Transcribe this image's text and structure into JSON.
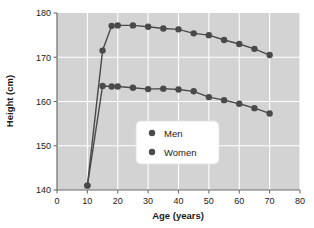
{
  "chart_data": {
    "type": "line",
    "title": "",
    "xlabel": "Age (years)",
    "ylabel": "Height (cm)",
    "xlim": [
      0,
      80
    ],
    "ylim": [
      140,
      180
    ],
    "xticks": [
      0,
      10,
      20,
      30,
      40,
      50,
      60,
      70,
      80
    ],
    "yticks": [
      140,
      150,
      160,
      170,
      180
    ],
    "grid": true,
    "grid_color": "#ffffff",
    "plot_background": "#d3d3d3",
    "figure_background": "#ffffff",
    "series_color": "#4a4a4a",
    "legend_position": "center-right-lower",
    "x": [
      10,
      15,
      18,
      20,
      25,
      30,
      35,
      40,
      45,
      50,
      55,
      60,
      65,
      70
    ],
    "series": [
      {
        "name": "Men",
        "values": [
          141,
          171.5,
          177.1,
          177.2,
          177.2,
          176.9,
          176.5,
          176.3,
          175.4,
          175.0,
          173.9,
          173.0,
          171.9,
          170.5
        ]
      },
      {
        "name": "Women",
        "values": [
          141,
          163.5,
          163.4,
          163.4,
          163.1,
          162.8,
          162.9,
          162.7,
          162.3,
          161.0,
          160.3,
          159.5,
          158.5,
          157.3
        ]
      }
    ],
    "legend": [
      "Men",
      "Women"
    ],
    "marker": "circle",
    "marker_size": 3.2,
    "line_width": 1.4
  },
  "axes": {
    "x_tick_labels": [
      "0",
      "10",
      "20",
      "30",
      "40",
      "50",
      "60",
      "70",
      "80"
    ],
    "y_tick_labels": [
      "140",
      "150",
      "160",
      "170",
      "180"
    ],
    "x_axis_title": "Age (years)",
    "y_axis_title": "Height (cm)"
  },
  "legend": {
    "items": [
      {
        "label": "Men",
        "marker": "dot-marker"
      },
      {
        "label": "Women",
        "marker": "dot-marker"
      }
    ]
  }
}
